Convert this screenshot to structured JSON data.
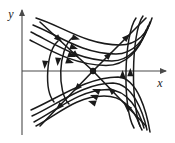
{
  "figure": {
    "kind": "phase-portrait",
    "caption": "",
    "background_color": "#ffffff",
    "stroke_color": "#1a1a1a",
    "axis_color": "#4a4a4a"
  },
  "axes": {
    "x_label": "x",
    "y_label": "y",
    "x_axis": {
      "x1": 22,
      "y1": 71,
      "x2": 168,
      "y2": 71,
      "arrow": "right"
    },
    "y_axis": {
      "x1": 22,
      "y1": 135,
      "x2": 22,
      "y2": 8,
      "arrow": "up"
    },
    "x_label_pos": {
      "x": 160,
      "y": 85
    },
    "y_label_pos": {
      "x": 10,
      "y": 16
    }
  },
  "chart_data": {
    "type": "scatter",
    "title": "",
    "xlabel": "x",
    "ylabel": "y",
    "grid": false,
    "legend": "none",
    "system": "saddle point (hyperbolic equilibrium)",
    "equilibrium_points": [
      {
        "name": "saddle",
        "x_px": 93,
        "y_px": 71,
        "marker": "filled-circle",
        "radius_px": 3.2
      }
    ],
    "separatrices": [
      {
        "name": "stable-separatrix-upper-left",
        "direction": "inward",
        "path": "M 40 22 L 93 71",
        "arrows": [
          {
            "x": 62,
            "y": 42,
            "angle_deg": 43
          },
          {
            "x": 79,
            "y": 58,
            "angle_deg": 43
          }
        ]
      },
      {
        "name": "stable-separatrix-lower-right",
        "direction": "inward",
        "path": "M 146 126 L 93 71",
        "arrows": [
          {
            "x": 124,
            "y": 104,
            "angle_deg": 224
          },
          {
            "x": 108,
            "y": 87,
            "angle_deg": 224
          }
        ]
      },
      {
        "name": "unstable-separatrix-upper-right",
        "direction": "outward",
        "path": "M 93 71 L 146 18",
        "arrows": [
          {
            "x": 112,
            "y": 52,
            "angle_deg": -45
          },
          {
            "x": 130,
            "y": 34,
            "angle_deg": -45
          }
        ]
      },
      {
        "name": "unstable-separatrix-lower-left",
        "direction": "outward",
        "path": "M 93 71 L 40 126",
        "arrows": [
          {
            "x": 74,
            "y": 91,
            "angle_deg": 134
          },
          {
            "x": 56,
            "y": 110,
            "angle_deg": 134
          }
        ]
      }
    ],
    "trajectories": [
      {
        "name": "upper-branch-1",
        "region": "top",
        "path": "M 36 18 C 62 26, 86 45, 120 45 C 138 45, 148 32, 152 18",
        "arrows": [
          {
            "x": 80,
            "y": 39.5,
            "angle_deg": 17
          }
        ]
      },
      {
        "name": "upper-branch-2",
        "region": "top",
        "path": "M 33 25 C 58 35, 82 54, 116 54 C 133 54, 145 40, 150 22",
        "arrows": [
          {
            "x": 78,
            "y": 49,
            "angle_deg": 19
          }
        ]
      },
      {
        "name": "upper-branch-3",
        "region": "top",
        "path": "M 31 32 C 55 44, 79 61, 112 61 C 129 61, 142 46, 148 26",
        "arrows": [
          {
            "x": 76,
            "y": 57,
            "angle_deg": 20
          }
        ]
      },
      {
        "name": "upper-branch-4",
        "region": "top",
        "path": "M 30 40 C 53 52, 76 65, 106 65.5 C 126 65.5, 140 50, 146 30",
        "arrows": [
          {
            "x": 74,
            "y": 63,
            "angle_deg": 18
          }
        ]
      },
      {
        "name": "lower-branch-1",
        "region": "bottom",
        "path": "M 140 126 C 134 108, 122 96, 104 96 C 76 96, 56 116, 36 126",
        "arrows": [
          {
            "x": 88,
            "y": 101,
            "angle_deg": 198
          }
        ]
      },
      {
        "name": "lower-branch-2",
        "region": "bottom",
        "path": "M 144 128 C 139 110, 128 90, 108 89.5 C 80 89.5, 57 110, 34 122",
        "arrows": [
          {
            "x": 90,
            "y": 95,
            "angle_deg": 199
          }
        ]
      },
      {
        "name": "lower-branch-3",
        "region": "bottom",
        "path": "M 147 130 C 143 112, 133 84, 113 83 C 84 83, 58 104, 32 116",
        "arrows": [
          {
            "x": 92,
            "y": 89,
            "angle_deg": 200
          }
        ]
      },
      {
        "name": "lower-branch-4",
        "region": "bottom",
        "path": "M 150 132 C 147 114, 138 78, 118 77 C 88 77, 58 98, 31 110",
        "arrows": []
      },
      {
        "name": "left-branch-1",
        "region": "left",
        "path": "M 58 41 C 46 52, 44 90, 54 102",
        "arrows": [
          {
            "x": 44.5,
            "y": 69,
            "angle_deg": 95
          }
        ]
      },
      {
        "name": "left-branch-2",
        "region": "left",
        "path": "M 72 38 C 58 50, 57 92, 69 104",
        "arrows": [
          {
            "x": 57.5,
            "y": 66,
            "angle_deg": 95
          }
        ]
      },
      {
        "name": "right-branch-1",
        "region": "right",
        "path": "M 136 18 C 124 34, 122 108, 134 128",
        "arrows": [
          {
            "x": 122.6,
            "y": 70,
            "angle_deg": -90
          }
        ]
      },
      {
        "name": "right-branch-2",
        "region": "right",
        "path": "M 143 16 C 131 32, 130 110, 142 130",
        "arrows": [
          {
            "x": 130.3,
            "y": 68,
            "angle_deg": -90
          }
        ]
      }
    ],
    "axis_ranges": {
      "xlim_px": [
        22,
        168
      ],
      "ylim_px": [
        8,
        135
      ]
    }
  }
}
